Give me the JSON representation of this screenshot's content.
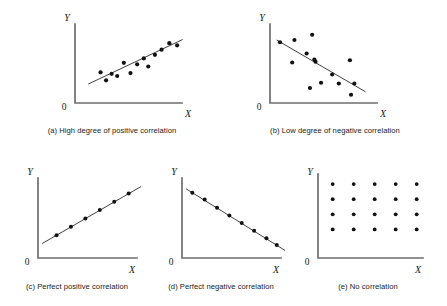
{
  "figure": {
    "axis_label_x": "X",
    "axis_label_y": "Y",
    "origin_label": "0",
    "colors": {
      "axis": "#6e6e6e",
      "trend_line": "#2b2b2b",
      "dot": "#111111",
      "background": "#ffffff",
      "text": "#1a1a1a"
    }
  },
  "panels": [
    {
      "id": "a",
      "caption": "(a) High degree of positive correlation",
      "label": "a",
      "title": "High degree of positive correlation"
    },
    {
      "id": "b",
      "caption": "(b) Low degree of negative correlation",
      "label": "b",
      "title": "Low degree of negative correlation"
    },
    {
      "id": "c",
      "caption": "(c) Perfect positive correlation",
      "label": "c",
      "title": "Perfect positive correlation"
    },
    {
      "id": "d",
      "caption": "(d) Perfect negative correlation",
      "label": "d",
      "title": "Perfect negative correlation"
    },
    {
      "id": "e",
      "caption": "(e) No correlation",
      "label": "e",
      "title": "No correlation"
    }
  ],
  "chart_data": [
    {
      "type": "scatter",
      "id": "a",
      "title": "(a) High degree of positive correlation",
      "xlabel": "X",
      "ylabel": "Y",
      "xlim": [
        0,
        100
      ],
      "ylim": [
        0,
        100
      ],
      "grid": false,
      "legend": false,
      "points": [
        {
          "x": 23,
          "y": 42
        },
        {
          "x": 28,
          "y": 31
        },
        {
          "x": 33,
          "y": 40
        },
        {
          "x": 38,
          "y": 37
        },
        {
          "x": 44,
          "y": 55
        },
        {
          "x": 50,
          "y": 41
        },
        {
          "x": 56,
          "y": 53
        },
        {
          "x": 62,
          "y": 61
        },
        {
          "x": 66,
          "y": 50
        },
        {
          "x": 72,
          "y": 66
        },
        {
          "x": 78,
          "y": 73
        },
        {
          "x": 85,
          "y": 82
        },
        {
          "x": 92,
          "y": 79
        }
      ],
      "trend_line": {
        "x0": 12,
        "y0": 26,
        "x1": 97,
        "y1": 87,
        "kind": "best-fit"
      }
    },
    {
      "type": "scatter",
      "id": "b",
      "title": "(b) Low degree of negative correlation",
      "xlabel": "X",
      "ylabel": "Y",
      "xlim": [
        0,
        100
      ],
      "ylim": [
        0,
        100
      ],
      "grid": false,
      "legend": false,
      "points": [
        {
          "x": 9,
          "y": 81
        },
        {
          "x": 22,
          "y": 84
        },
        {
          "x": 38,
          "y": 91
        },
        {
          "x": 33,
          "y": 66
        },
        {
          "x": 20,
          "y": 54
        },
        {
          "x": 41,
          "y": 55
        },
        {
          "x": 40,
          "y": 58
        },
        {
          "x": 72,
          "y": 57
        },
        {
          "x": 56,
          "y": 38
        },
        {
          "x": 46,
          "y": 27
        },
        {
          "x": 62,
          "y": 26
        },
        {
          "x": 76,
          "y": 26
        },
        {
          "x": 36,
          "y": 20
        },
        {
          "x": 73,
          "y": 11
        }
      ],
      "trend_line": {
        "x0": 6,
        "y0": 84,
        "x1": 86,
        "y1": 15,
        "kind": "best-fit"
      }
    },
    {
      "type": "scatter",
      "id": "c",
      "title": "(c) Perfect positive correlation",
      "xlabel": "X",
      "ylabel": "Y",
      "xlim": [
        0,
        100
      ],
      "ylim": [
        0,
        100
      ],
      "grid": false,
      "legend": false,
      "points": [
        {
          "x": 18,
          "y": 30
        },
        {
          "x": 32,
          "y": 41
        },
        {
          "x": 46,
          "y": 52
        },
        {
          "x": 60,
          "y": 63
        },
        {
          "x": 74,
          "y": 74
        },
        {
          "x": 88,
          "y": 85
        }
      ],
      "trend_line": {
        "x0": 4,
        "y0": 19,
        "x1": 100,
        "y1": 94,
        "kind": "exact"
      }
    },
    {
      "type": "scatter",
      "id": "d",
      "title": "(d) Perfect negative correlation",
      "xlabel": "X",
      "ylabel": "Y",
      "xlim": [
        0,
        100
      ],
      "ylim": [
        0,
        100
      ],
      "grid": false,
      "legend": false,
      "points": [
        {
          "x": 10,
          "y": 86
        },
        {
          "x": 22,
          "y": 77
        },
        {
          "x": 34,
          "y": 66
        },
        {
          "x": 46,
          "y": 56
        },
        {
          "x": 58,
          "y": 46
        },
        {
          "x": 70,
          "y": 36
        },
        {
          "x": 82,
          "y": 26
        },
        {
          "x": 92,
          "y": 17
        }
      ],
      "trend_line": {
        "x0": 4,
        "y0": 91,
        "x1": 100,
        "y1": 10,
        "kind": "exact"
      }
    },
    {
      "type": "scatter",
      "id": "e",
      "title": "(e) No correlation",
      "xlabel": "X",
      "ylabel": "Y",
      "xlim": [
        0,
        100
      ],
      "ylim": [
        0,
        100
      ],
      "grid": false,
      "legend": false,
      "grid_points": {
        "columns": 5,
        "rows": 4,
        "total": 20
      },
      "points": [
        {
          "x": 14,
          "y": 88
        },
        {
          "x": 34,
          "y": 88
        },
        {
          "x": 54,
          "y": 88
        },
        {
          "x": 74,
          "y": 88
        },
        {
          "x": 94,
          "y": 88
        },
        {
          "x": 14,
          "y": 70
        },
        {
          "x": 34,
          "y": 70
        },
        {
          "x": 54,
          "y": 70
        },
        {
          "x": 74,
          "y": 70
        },
        {
          "x": 94,
          "y": 70
        },
        {
          "x": 14,
          "y": 52
        },
        {
          "x": 34,
          "y": 52
        },
        {
          "x": 54,
          "y": 52
        },
        {
          "x": 74,
          "y": 52
        },
        {
          "x": 94,
          "y": 52
        },
        {
          "x": 14,
          "y": 34
        },
        {
          "x": 34,
          "y": 34
        },
        {
          "x": 54,
          "y": 34
        },
        {
          "x": 74,
          "y": 34
        },
        {
          "x": 94,
          "y": 34
        }
      ],
      "trend_line": null
    }
  ]
}
